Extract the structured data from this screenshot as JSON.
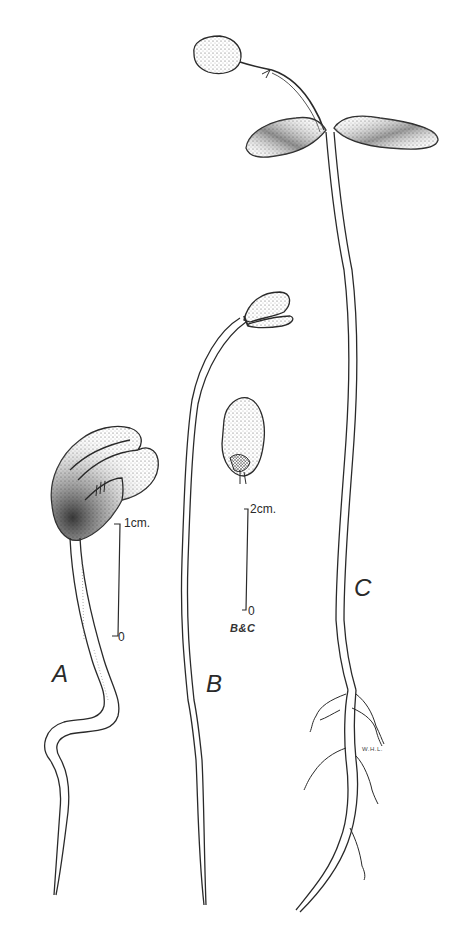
{
  "figure": {
    "background_color": "#ffffff",
    "ink_color": "#2a2a2a",
    "specimens": [
      {
        "id": "A",
        "label": "A",
        "description": "young seedling with hooked hypocotyl and closed cotyledons"
      },
      {
        "id": "B",
        "label": "B",
        "description": "elongated seedling with opening cotyledons; detached cotyledon shown"
      },
      {
        "id": "C",
        "label": "C",
        "description": "mature seedling with expanded cotyledons, first leaf and branched roots"
      }
    ],
    "scale_bars": [
      {
        "id": "scale-a",
        "top_label": "1cm.",
        "bottom_label": "0"
      },
      {
        "id": "scale-bc",
        "top_label": "2cm.",
        "bottom_label": "0",
        "caption": "B&C"
      }
    ],
    "artist_initials": "W.H.L."
  }
}
